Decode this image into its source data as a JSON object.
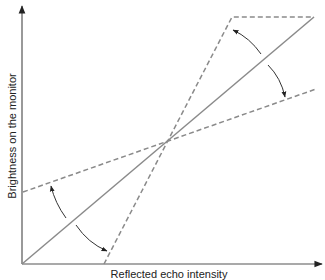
{
  "diagram": {
    "title": "",
    "x_axis_label": "Reflected echo intensity",
    "y_axis_label": "Brightness on the monitor",
    "colors": {
      "axis": "#555555",
      "line": "#8a8a8a",
      "arrow": "#333333",
      "text": "#222222"
    },
    "elements": [
      {
        "id": "reference-line",
        "style": "solid",
        "description": "linear mapping from origin to upper right"
      },
      {
        "id": "high-contrast-line",
        "style": "dashed",
        "description": "steeper line, clipped at top with horizontal dashed segment"
      },
      {
        "id": "low-contrast-line",
        "style": "dashed",
        "description": "shallower line starting above origin"
      },
      {
        "id": "rotation-arrows",
        "count": 4,
        "description": "curved arrows indicating rotation of curve about center point"
      }
    ]
  }
}
